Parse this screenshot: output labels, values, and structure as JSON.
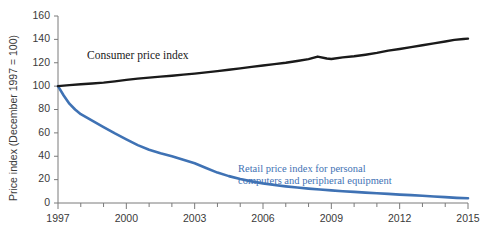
{
  "chart_data": {
    "type": "line",
    "title": "",
    "xlabel": "",
    "ylabel": "Price index (December 1997 = 100)",
    "xlim": [
      1997,
      2015
    ],
    "ylim": [
      0,
      160
    ],
    "grid": false,
    "legend_position": "inline-annotations",
    "ytick_labels": [
      "0",
      "20",
      "40",
      "60",
      "80",
      "100",
      "120",
      "140",
      "160"
    ],
    "yticks": [
      0,
      20,
      40,
      60,
      80,
      100,
      120,
      140,
      160
    ],
    "xtick_labels": [
      "1997",
      "2000",
      "2003",
      "2006",
      "2009",
      "2012",
      "2015"
    ],
    "xticks": [
      1997,
      2000,
      2003,
      2006,
      2009,
      2012,
      2015
    ],
    "xminor_ticks": [
      1998,
      1999,
      2001,
      2002,
      2004,
      2005,
      2007,
      2008,
      2010,
      2011,
      2013,
      2014
    ],
    "series": [
      {
        "name": "Consumer price index",
        "color": "#1a1a1a",
        "label_lines": [
          "Consumer price index"
        ],
        "x": [
          1997.0,
          1997.5,
          1998.0,
          1998.5,
          1999.0,
          1999.5,
          2000.0,
          2000.5,
          2001.0,
          2001.5,
          2002.0,
          2002.5,
          2003.0,
          2003.5,
          2004.0,
          2004.5,
          2005.0,
          2005.5,
          2006.0,
          2006.5,
          2007.0,
          2007.5,
          2008.0,
          2008.4,
          2008.8,
          2009.0,
          2009.5,
          2010.0,
          2010.5,
          2011.0,
          2011.5,
          2012.0,
          2012.5,
          2013.0,
          2013.5,
          2014.0,
          2014.4,
          2014.8,
          2015.0
        ],
        "y": [
          100.0,
          100.9,
          101.6,
          102.3,
          103.0,
          104.1,
          105.3,
          106.4,
          107.3,
          108.1,
          108.9,
          109.8,
          110.7,
          111.8,
          112.8,
          114.0,
          115.2,
          116.5,
          117.7,
          118.8,
          120.0,
          121.5,
          123.1,
          125.3,
          123.6,
          123.2,
          124.6,
          125.6,
          126.9,
          128.4,
          130.4,
          131.8,
          133.4,
          135.0,
          136.6,
          138.2,
          139.6,
          140.3,
          140.6
        ]
      },
      {
        "name": "Retail price index for personal computers and peripheral equipment",
        "color": "#3f72b4",
        "label_lines": [
          "Retail price index for personal",
          "computers and peripheral equipment"
        ],
        "x": [
          1997.0,
          1997.25,
          1997.5,
          1997.75,
          1998.0,
          1998.5,
          1999.0,
          1999.5,
          2000.0,
          2000.5,
          2001.0,
          2001.5,
          2002.0,
          2002.5,
          2003.0,
          2003.5,
          2004.0,
          2004.5,
          2005.0,
          2005.5,
          2006.0,
          2006.5,
          2007.0,
          2007.5,
          2008.0,
          2008.5,
          2009.0,
          2009.5,
          2010.0,
          2010.5,
          2011.0,
          2011.5,
          2012.0,
          2012.5,
          2013.0,
          2013.5,
          2014.0,
          2014.5,
          2015.0
        ],
        "y": [
          100.0,
          92.0,
          85.0,
          80.0,
          76.0,
          70.5,
          65.0,
          59.5,
          54.5,
          49.5,
          45.5,
          42.5,
          40.0,
          37.0,
          34.0,
          30.0,
          26.0,
          23.0,
          20.5,
          18.5,
          16.8,
          15.4,
          14.2,
          13.2,
          12.3,
          11.5,
          10.8,
          10.1,
          9.5,
          8.9,
          8.3,
          7.8,
          7.2,
          6.7,
          6.2,
          5.6,
          5.0,
          4.4,
          4.0
        ]
      }
    ]
  },
  "labels": {
    "y_axis_title": "Price index (December 1997 = 100)",
    "black_series_annotation": "Consumer price index",
    "blue_series_annotation_line1": "Retail price index for personal",
    "blue_series_annotation_line2": "computers and peripheral equipment"
  },
  "colors": {
    "black_series": "#1a1a1a",
    "blue_series": "#3f72b4",
    "axis": "#7a7a7a",
    "text": "#3a3a3a",
    "background": "#ffffff"
  }
}
